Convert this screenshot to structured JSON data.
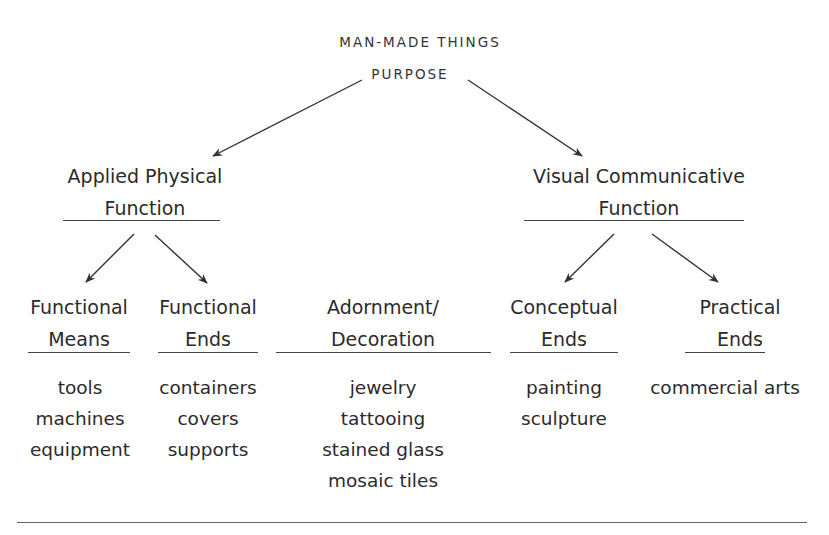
{
  "diagram": {
    "title": "MAN-MADE THINGS",
    "subtitle": "PURPOSE",
    "branches": [
      {
        "label_line1": "Applied Physical",
        "label_line2": "Function",
        "children": [
          {
            "label_line1": "Functional",
            "label_line2": "Means",
            "items": [
              "tools",
              "machines",
              "equipment"
            ]
          },
          {
            "label_line1": "Functional",
            "label_line2": "Ends",
            "items": [
              "containers",
              "covers",
              "supports"
            ]
          }
        ]
      },
      {
        "label_line1": "Visual Communicative",
        "label_line2": "Function",
        "children": [
          {
            "label_line1": "Conceptual",
            "label_line2": "Ends",
            "items": [
              "painting",
              "sculpture"
            ]
          },
          {
            "label_line1": "Practical",
            "label_line2": "Ends",
            "items": [
              "commercial arts"
            ]
          }
        ]
      }
    ],
    "standalone": {
      "label_line1": "Adornment/",
      "label_line2": "Decoration",
      "items": [
        "jewelry",
        "tattooing",
        "stained glass",
        "mosaic tiles"
      ]
    }
  }
}
